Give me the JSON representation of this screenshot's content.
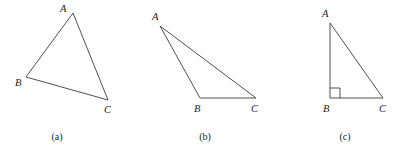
{
  "figure": {
    "background_color": "#ffffff",
    "stroke_color": "#3c3c3c",
    "label_color": "#1a1a1a",
    "width": 410,
    "height": 150,
    "panels": [
      {
        "id": "panel-a",
        "caption": "(a)",
        "caption_x": 57,
        "caption_y": 140,
        "type": "acute-triangle",
        "vertices": [
          {
            "name": "A",
            "x": 73,
            "y": 13,
            "label_x": 60,
            "label_y": 12
          },
          {
            "name": "B",
            "x": 26,
            "y": 77,
            "label_x": 15,
            "label_y": 86
          },
          {
            "name": "C",
            "x": 108,
            "y": 100,
            "label_x": 104,
            "label_y": 113
          }
        ],
        "edges": [
          {
            "from": "A",
            "to": "B"
          },
          {
            "from": "B",
            "to": "C"
          },
          {
            "from": "C",
            "to": "A"
          }
        ],
        "right_angle": null
      },
      {
        "id": "panel-b",
        "caption": "(b)",
        "caption_x": 205,
        "caption_y": 140,
        "type": "obtuse-triangle",
        "vertices": [
          {
            "name": "A",
            "x": 160,
            "y": 26,
            "label_x": 152,
            "label_y": 20
          },
          {
            "name": "B",
            "x": 200,
            "y": 98,
            "label_x": 194,
            "label_y": 112
          },
          {
            "name": "C",
            "x": 256,
            "y": 98,
            "label_x": 251,
            "label_y": 112
          }
        ],
        "edges": [
          {
            "from": "A",
            "to": "B"
          },
          {
            "from": "B",
            "to": "C"
          },
          {
            "from": "C",
            "to": "A"
          }
        ],
        "right_angle": null
      },
      {
        "id": "panel-c",
        "caption": "(c)",
        "caption_x": 345,
        "caption_y": 140,
        "type": "right-triangle",
        "vertices": [
          {
            "name": "A",
            "x": 330,
            "y": 23,
            "label_x": 322,
            "label_y": 17
          },
          {
            "name": "B",
            "x": 330,
            "y": 98,
            "label_x": 323,
            "label_y": 112
          },
          {
            "name": "C",
            "x": 383,
            "y": 98,
            "label_x": 379,
            "label_y": 112
          }
        ],
        "edges": [
          {
            "from": "A",
            "to": "B"
          },
          {
            "from": "B",
            "to": "C"
          },
          {
            "from": "C",
            "to": "A"
          }
        ],
        "right_angle": {
          "at": "B",
          "x": 330,
          "y": 88,
          "size": 10
        }
      }
    ]
  }
}
